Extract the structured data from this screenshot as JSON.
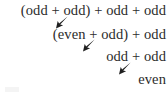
{
  "figure": {
    "background_color": "#ffffff",
    "text_color": "#2b2b2b",
    "arrow_color": "#1f1f1f",
    "lines": [
      {
        "text": "(odd + odd) + odd + odd"
      },
      {
        "text": "(even + odd) + odd"
      },
      {
        "text": "odd + odd"
      },
      {
        "text": "even"
      }
    ],
    "arrows": [
      {
        "name": "reduction-arrow-1",
        "direction": "down-left"
      },
      {
        "name": "reduction-arrow-2",
        "direction": "down-left"
      },
      {
        "name": "reduction-arrow-3",
        "direction": "down-left"
      }
    ]
  }
}
